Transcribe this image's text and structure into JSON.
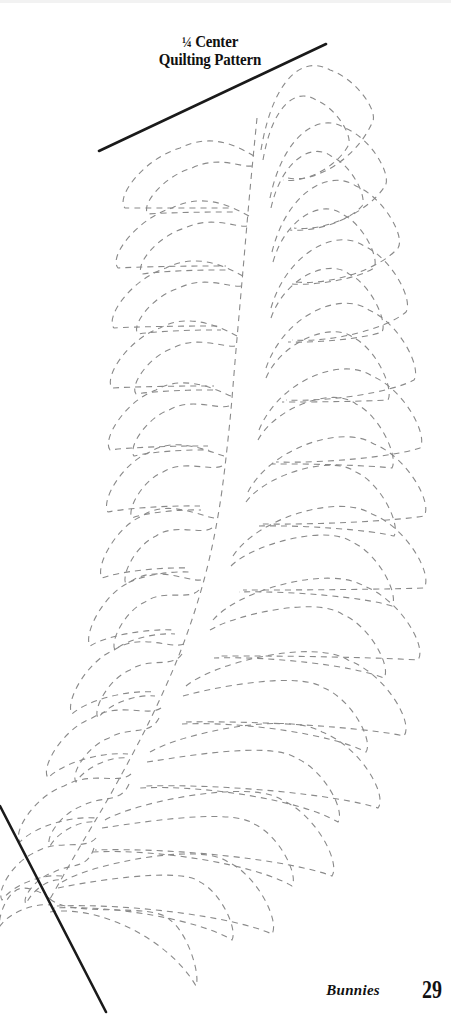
{
  "page": {
    "width": 451,
    "height": 1021,
    "background_color": "#ffffff"
  },
  "title": {
    "line_1_fraction": "¼",
    "line_1_rest": "Center",
    "line_2": "Quilting Pattern",
    "color": "#111111"
  },
  "footer": {
    "chapter_label": "Bunnies",
    "page_number": "29"
  },
  "drawing": {
    "stroke_color_dashed": "#8a8a8a",
    "stroke_color_solid": "#1a1a1a",
    "dash_pattern": "6 5",
    "dash_width": 1.1,
    "solid_width": 2.6,
    "guides": [
      {
        "name": "top-guide-line",
        "x1": 99,
        "y1": 151,
        "x2": 326,
        "y2": 44
      },
      {
        "name": "bottom-guide-line",
        "x1": 0,
        "y1": 806,
        "x2": 106,
        "y2": 1012
      }
    ],
    "spine": {
      "name": "feather-spine",
      "points": [
        [
          257,
          118
        ],
        [
          250,
          190
        ],
        [
          243,
          270
        ],
        [
          236,
          350
        ],
        [
          229,
          430
        ],
        [
          219,
          510
        ],
        [
          204,
          580
        ],
        [
          181,
          650
        ],
        [
          150,
          720
        ],
        [
          113,
          790
        ],
        [
          78,
          850
        ],
        [
          50,
          899
        ]
      ]
    },
    "convergence_point": [
      50,
      899
    ],
    "right_lobes": [
      {
        "tip": [
          261,
          150
        ],
        "apex": [
          330,
          70
        ],
        "outer": [
          372,
          123
        ],
        "base": [
          288,
          178
        ]
      },
      {
        "tip": [
          270,
          198
        ],
        "apex": [
          345,
          128
        ],
        "outer": [
          385,
          186
        ],
        "base": [
          294,
          228
        ]
      },
      {
        "tip": [
          272,
          252
        ],
        "apex": [
          356,
          186
        ],
        "outer": [
          398,
          248
        ],
        "base": [
          296,
          282
        ]
      },
      {
        "tip": [
          271,
          308
        ],
        "apex": [
          364,
          246
        ],
        "outer": [
          406,
          312
        ],
        "base": [
          292,
          340
        ]
      },
      {
        "tip": [
          266,
          368
        ],
        "apex": [
          369,
          310
        ],
        "outer": [
          414,
          380
        ],
        "base": [
          286,
          400
        ]
      },
      {
        "tip": [
          259,
          430
        ],
        "apex": [
          372,
          376
        ],
        "outer": [
          420,
          448
        ],
        "base": [
          276,
          462
        ]
      },
      {
        "tip": [
          248,
          492
        ],
        "apex": [
          374,
          444
        ],
        "outer": [
          424,
          516
        ],
        "base": [
          262,
          524
        ]
      },
      {
        "tip": [
          233,
          556
        ],
        "apex": [
          372,
          514
        ],
        "outer": [
          424,
          588
        ],
        "base": [
          243,
          590
        ]
      },
      {
        "tip": [
          213,
          620
        ],
        "apex": [
          364,
          586
        ],
        "outer": [
          418,
          660
        ],
        "base": [
          218,
          656
        ]
      },
      {
        "tip": [
          186,
          686
        ],
        "apex": [
          348,
          660
        ],
        "outer": [
          404,
          736
        ],
        "base": [
          186,
          722
        ]
      },
      {
        "tip": [
          150,
          752
        ],
        "apex": [
          322,
          732
        ],
        "outer": [
          378,
          808
        ],
        "base": [
          144,
          786
        ]
      },
      {
        "tip": [
          105,
          820
        ],
        "apex": [
          282,
          800
        ],
        "outer": [
          332,
          876
        ],
        "base": [
          95,
          850
        ]
      },
      {
        "tip": [
          62,
          882
        ],
        "apex": [
          228,
          862
        ],
        "outer": [
          272,
          934
        ],
        "base": [
          56,
          906
        ]
      },
      {
        "tip": [
          50,
          899
        ],
        "apex": [
          170,
          920
        ],
        "outer": [
          196,
          986
        ],
        "base": [
          50,
          912
        ]
      }
    ],
    "left_lobes": [
      {
        "tip": [
          254,
          156
        ],
        "apex": [
          180,
          148
        ],
        "outer": [
          125,
          208
        ],
        "base": [
          232,
          208
        ]
      },
      {
        "tip": [
          249,
          216
        ],
        "apex": [
          172,
          208
        ],
        "outer": [
          118,
          268
        ],
        "base": [
          226,
          266
        ]
      },
      {
        "tip": [
          243,
          276
        ],
        "apex": [
          166,
          268
        ],
        "outer": [
          114,
          328
        ],
        "base": [
          220,
          326
        ]
      },
      {
        "tip": [
          237,
          336
        ],
        "apex": [
          160,
          328
        ],
        "outer": [
          112,
          388
        ],
        "base": [
          214,
          386
        ]
      },
      {
        "tip": [
          231,
          396
        ],
        "apex": [
          156,
          390
        ],
        "outer": [
          110,
          450
        ],
        "base": [
          208,
          446
        ]
      },
      {
        "tip": [
          224,
          456
        ],
        "apex": [
          150,
          452
        ],
        "outer": [
          108,
          512
        ],
        "base": [
          200,
          506
        ]
      },
      {
        "tip": [
          214,
          518
        ],
        "apex": [
          142,
          516
        ],
        "outer": [
          102,
          578
        ],
        "base": [
          189,
          568
        ]
      },
      {
        "tip": [
          201,
          580
        ],
        "apex": [
          130,
          582
        ],
        "outer": [
          90,
          646
        ],
        "base": [
          174,
          630
        ]
      },
      {
        "tip": [
          184,
          644
        ],
        "apex": [
          114,
          650
        ],
        "outer": [
          72,
          714
        ],
        "base": [
          154,
          692
        ]
      },
      {
        "tip": [
          161,
          708
        ],
        "apex": [
          92,
          718
        ],
        "outer": [
          48,
          778
        ],
        "base": [
          128,
          754
        ]
      },
      {
        "tip": [
          131,
          774
        ],
        "apex": [
          64,
          786
        ],
        "outer": [
          20,
          842
        ],
        "base": [
          96,
          818
        ]
      },
      {
        "tip": [
          96,
          838
        ],
        "apex": [
          36,
          852
        ],
        "outer": [
          2,
          900
        ],
        "base": [
          62,
          876
        ]
      },
      {
        "tip": [
          50,
          899
        ],
        "apex": [
          14,
          892
        ],
        "outer": [
          0,
          926
        ],
        "base": [
          50,
          905
        ]
      }
    ],
    "inner_right_lobes": [
      {
        "tip": [
          263,
          160
        ],
        "apex": [
          316,
          100
        ],
        "outer": [
          348,
          146
        ],
        "base": [
          283,
          180
        ]
      },
      {
        "tip": [
          271,
          208
        ],
        "apex": [
          331,
          156
        ],
        "outer": [
          362,
          206
        ],
        "base": [
          290,
          230
        ]
      },
      {
        "tip": [
          273,
          262
        ],
        "apex": [
          342,
          214
        ],
        "outer": [
          374,
          268
        ],
        "base": [
          292,
          284
        ]
      },
      {
        "tip": [
          271,
          318
        ],
        "apex": [
          349,
          274
        ],
        "outer": [
          382,
          332
        ],
        "base": [
          288,
          342
        ]
      },
      {
        "tip": [
          266,
          378
        ],
        "apex": [
          354,
          338
        ],
        "outer": [
          388,
          400
        ],
        "base": [
          282,
          402
        ]
      },
      {
        "tip": [
          258,
          440
        ],
        "apex": [
          356,
          404
        ],
        "outer": [
          392,
          468
        ],
        "base": [
          272,
          464
        ]
      },
      {
        "tip": [
          246,
          502
        ],
        "apex": [
          356,
          472
        ],
        "outer": [
          394,
          536
        ],
        "base": [
          258,
          526
        ]
      },
      {
        "tip": [
          231,
          566
        ],
        "apex": [
          352,
          542
        ],
        "outer": [
          392,
          606
        ],
        "base": [
          239,
          592
        ]
      },
      {
        "tip": [
          210,
          630
        ],
        "apex": [
          342,
          614
        ],
        "outer": [
          384,
          678
        ],
        "base": [
          214,
          658
        ]
      },
      {
        "tip": [
          183,
          696
        ],
        "apex": [
          324,
          688
        ],
        "outer": [
          366,
          752
        ],
        "base": [
          182,
          724
        ]
      },
      {
        "tip": [
          147,
          762
        ],
        "apex": [
          296,
          758
        ],
        "outer": [
          338,
          822
        ],
        "base": [
          140,
          788
        ]
      },
      {
        "tip": [
          102,
          828
        ],
        "apex": [
          254,
          824
        ],
        "outer": [
          292,
          886
        ],
        "base": [
          92,
          852
        ]
      },
      {
        "tip": [
          58,
          888
        ],
        "apex": [
          200,
          882
        ],
        "outer": [
          232,
          940
        ],
        "base": [
          54,
          908
        ]
      }
    ],
    "inner_left_lobes": [
      {
        "tip": [
          252,
          166
        ],
        "apex": [
          192,
          168
        ],
        "outer": [
          148,
          214
        ],
        "base": [
          233,
          212
        ]
      },
      {
        "tip": [
          247,
          226
        ],
        "apex": [
          185,
          228
        ],
        "outer": [
          142,
          274
        ],
        "base": [
          227,
          270
        ]
      },
      {
        "tip": [
          241,
          286
        ],
        "apex": [
          179,
          288
        ],
        "outer": [
          138,
          334
        ],
        "base": [
          221,
          330
        ]
      },
      {
        "tip": [
          235,
          346
        ],
        "apex": [
          173,
          348
        ],
        "outer": [
          136,
          394
        ],
        "base": [
          215,
          390
        ]
      },
      {
        "tip": [
          229,
          406
        ],
        "apex": [
          169,
          410
        ],
        "outer": [
          134,
          456
        ],
        "base": [
          209,
          450
        ]
      },
      {
        "tip": [
          222,
          466
        ],
        "apex": [
          163,
          472
        ],
        "outer": [
          132,
          518
        ],
        "base": [
          201,
          510
        ]
      },
      {
        "tip": [
          212,
          528
        ],
        "apex": [
          156,
          536
        ],
        "outer": [
          126,
          584
        ],
        "base": [
          190,
          572
        ]
      },
      {
        "tip": [
          199,
          590
        ],
        "apex": [
          145,
          602
        ],
        "outer": [
          115,
          650
        ],
        "base": [
          175,
          634
        ]
      },
      {
        "tip": [
          182,
          654
        ],
        "apex": [
          130,
          670
        ],
        "outer": [
          98,
          718
        ],
        "base": [
          155,
          696
        ]
      },
      {
        "tip": [
          159,
          718
        ],
        "apex": [
          109,
          738
        ],
        "outer": [
          76,
          782
        ],
        "base": [
          129,
          758
        ]
      },
      {
        "tip": [
          129,
          784
        ],
        "apex": [
          82,
          806
        ],
        "outer": [
          50,
          846
        ],
        "base": [
          97,
          822
        ]
      },
      {
        "tip": [
          94,
          848
        ],
        "apex": [
          54,
          872
        ],
        "outer": [
          26,
          904
        ],
        "base": [
          63,
          880
        ]
      }
    ]
  }
}
